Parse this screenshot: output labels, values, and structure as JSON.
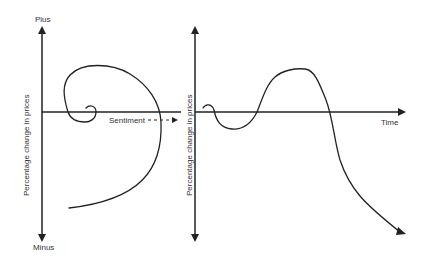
{
  "diagram": {
    "left_panel": {
      "y_axis_top_label": "Plus",
      "y_axis_bottom_label": "Minus",
      "y_axis_title": "Percentage change in prices",
      "curve": "spiral"
    },
    "connector": {
      "label": "Sentiment"
    },
    "right_panel": {
      "y_axis_title": "Percentage change in prices",
      "x_axis_label": "Time",
      "curve": "wave"
    },
    "colors": {
      "stroke": "#222222",
      "text": "#333333",
      "background": "#ffffff"
    }
  }
}
